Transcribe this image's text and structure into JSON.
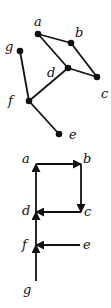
{
  "undirected_graph": {
    "nodes": [
      {
        "id": "a",
        "label": "a",
        "x": 38,
        "y": 34,
        "lx": 34,
        "ly": 26
      },
      {
        "id": "b",
        "label": "b",
        "x": 71,
        "y": 43,
        "lx": 75,
        "ly": 37
      },
      {
        "id": "c",
        "label": "c",
        "x": 97,
        "y": 77,
        "lx": 101,
        "ly": 98
      },
      {
        "id": "d",
        "label": "d",
        "x": 68,
        "y": 68,
        "lx": 47,
        "ly": 77
      },
      {
        "id": "e",
        "label": "e",
        "x": 59,
        "y": 134,
        "lx": 69,
        "ly": 139
      },
      {
        "id": "f",
        "label": "f",
        "x": 29,
        "y": 101,
        "lx": 8,
        "ly": 105
      },
      {
        "id": "g",
        "label": "g",
        "x": 20,
        "y": 51,
        "lx": 5,
        "ly": 51
      }
    ],
    "edges": [
      [
        "a",
        "b"
      ],
      [
        "a",
        "d"
      ],
      [
        "b",
        "c"
      ],
      [
        "d",
        "c"
      ],
      [
        "d",
        "f"
      ],
      [
        "g",
        "f"
      ],
      [
        "f",
        "e"
      ]
    ]
  },
  "directed_graph": {
    "nodes": [
      {
        "id": "a",
        "label": "a",
        "x": 36,
        "y": 164,
        "lx": 22,
        "ly": 163
      },
      {
        "id": "b",
        "label": "b",
        "x": 81,
        "y": 164,
        "lx": 83,
        "ly": 163
      },
      {
        "id": "c",
        "label": "c",
        "x": 81,
        "y": 212,
        "lx": 84,
        "ly": 216
      },
      {
        "id": "d",
        "label": "d",
        "x": 36,
        "y": 212,
        "lx": 22,
        "ly": 215
      },
      {
        "id": "e",
        "label": "e",
        "x": 80,
        "y": 245,
        "lx": 83,
        "ly": 249
      },
      {
        "id": "f",
        "label": "f",
        "x": 36,
        "y": 245,
        "lx": 22,
        "ly": 249
      },
      {
        "id": "g",
        "label": "g",
        "x": 36,
        "y": 281,
        "lx": 23,
        "ly": 294
      }
    ],
    "arcs": [
      [
        "a",
        "b"
      ],
      [
        "b",
        "c"
      ],
      [
        "c",
        "d"
      ],
      [
        "d",
        "a"
      ],
      [
        "e",
        "f"
      ],
      [
        "f",
        "d"
      ],
      [
        "g",
        "f"
      ]
    ]
  }
}
